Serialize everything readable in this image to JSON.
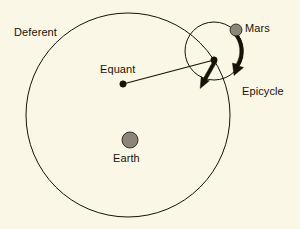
{
  "figure": {
    "background_color": "#faf7e6",
    "stroke_color": "#171208",
    "body_fill_color": "#8b8679"
  },
  "labels": {
    "deferent": "Deferent",
    "equant": "Equant",
    "earth": "Earth",
    "mars": "Mars",
    "epicycle": "Epicycle"
  },
  "diagram_data": {
    "type": "diagram",
    "subject": "Ptolemaic geocentric model of Mars",
    "coordinate_space": {
      "width": 300,
      "height": 229
    },
    "circles": [
      {
        "name": "deferent",
        "label": "Deferent",
        "cx": 128,
        "cy": 115,
        "r": 102,
        "stroke": "#171208",
        "stroke_width": 1,
        "fill": "none"
      },
      {
        "name": "epicycle",
        "label": "Epicycle",
        "cx": 214,
        "cy": 51,
        "r": 29,
        "stroke": "#171208",
        "stroke_width": 1,
        "fill": "none"
      }
    ],
    "points": [
      {
        "name": "earth",
        "label": "Earth",
        "x": 130,
        "y": 140,
        "r": 8,
        "fill": "#8b8679",
        "stroke": "#171208",
        "label_position": "below"
      },
      {
        "name": "equant",
        "label": "Equant",
        "x": 123,
        "y": 84,
        "r": 3,
        "fill": "#171208",
        "stroke": "#171208",
        "label_position": "above-left"
      },
      {
        "name": "epicycle-center",
        "label": "",
        "x": 214,
        "y": 60,
        "r": 3,
        "fill": "#171208",
        "stroke": "#171208",
        "label_position": "none"
      },
      {
        "name": "mars",
        "label": "Mars",
        "x": 236,
        "y": 30,
        "r": 6,
        "fill": "#8b8679",
        "stroke": "#171208",
        "label_position": "right"
      }
    ],
    "lines": [
      {
        "name": "equant-to-epicycle-center",
        "x1": 123,
        "y1": 84,
        "x2": 214,
        "y2": 60,
        "stroke": "#171208",
        "stroke_width": 1.2
      }
    ],
    "arrows": [
      {
        "name": "epicycle-center-motion-arrow",
        "kind": "tapered-straight",
        "from_x": 214,
        "from_y": 60,
        "to_x": 201,
        "to_y": 85,
        "stroke": "#171208",
        "description": "thick tapered arrow from epicycle centre pointing down-left along the deferent"
      },
      {
        "name": "mars-epicyclic-motion-arrow",
        "kind": "tapered-arc",
        "center_x": 214,
        "center_y": 51,
        "radius": 29,
        "start_angle_deg": -42,
        "end_angle_deg": 46,
        "direction": "clockwise",
        "stroke": "#171208",
        "description": "thick tapered arc along the epicycle running clockwise from Mars downward"
      }
    ],
    "annotations": [
      {
        "name": "deferent-label",
        "text": "Deferent",
        "x": 14,
        "y": 27
      },
      {
        "name": "equant-label",
        "text": "Equant",
        "x": 100,
        "y": 64
      },
      {
        "name": "earth-label",
        "text": "Earth",
        "x": 113,
        "y": 153
      },
      {
        "name": "mars-label",
        "text": "Mars",
        "x": 245,
        "y": 23
      },
      {
        "name": "epicycle-label",
        "text": "Epicycle",
        "x": 242,
        "y": 86
      }
    ]
  }
}
